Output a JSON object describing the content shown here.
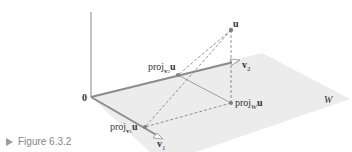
{
  "caption": {
    "text": "Figure 6.3.2"
  },
  "labels": {
    "origin": "0",
    "u": "u",
    "v1": "v",
    "v1_sub": "1",
    "v2": "v",
    "v2_sub": "2",
    "proj_prefix": "proj",
    "proj_v1_sub": "v",
    "proj_v1_subsub": "1",
    "proj_v2_sub": "v",
    "proj_v2_subsub": "2",
    "proj_W_sub": "W",
    "proj_u": "u",
    "plane": "W"
  },
  "colors": {
    "plane_fill": "#ececec",
    "axis": "#9a9a9a",
    "vector": "#8c8c8c",
    "dashed": "#7a7a7a",
    "point": "#808080",
    "text": "#333333",
    "caption": "#888888"
  }
}
